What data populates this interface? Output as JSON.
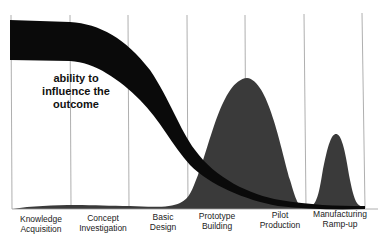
{
  "diagram": {
    "type": "conceptual-curve",
    "annotation": {
      "line1": "ability to",
      "line2": "influence the",
      "line3": "outcome"
    },
    "phases": [
      {
        "line1": "Knowledge",
        "line2": "Acquisition"
      },
      {
        "line1": "Concept",
        "line2": "Investigation"
      },
      {
        "line1": "Basic",
        "line2": "Design"
      },
      {
        "line1": "Prototype",
        "line2": "Building"
      },
      {
        "line1": "Pilot",
        "line2": "Production"
      },
      {
        "line1": "Manufacturing",
        "line2": "Ramp-up"
      }
    ],
    "colors": {
      "band": "#0a0a0a",
      "effort_area": "#3a3a3a",
      "grid_lines": "#9a9a9a",
      "text": "#222222"
    }
  }
}
